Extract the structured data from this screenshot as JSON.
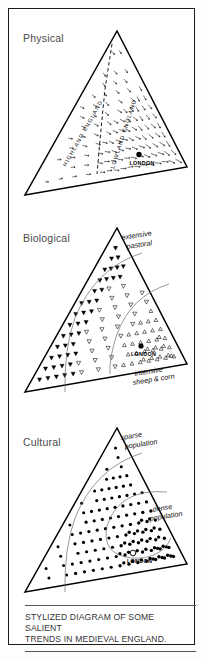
{
  "figure": {
    "caption": "STYLIZED DIAGRAM OF SOME SALIENT\nTRENDS IN MEDIEVAL ENGLAND.",
    "border_color": "#1a1a1a",
    "ink_color": "#000000",
    "background": "#ffffff"
  },
  "panels": [
    {
      "id": "physical",
      "title": "Physical",
      "symbol": "arrow",
      "city": {
        "name": "LONDON",
        "marker": "filled-dot",
        "x": 130,
        "y": 152
      },
      "zone_labels": [
        {
          "text": "HIGHLAND ENGLAND",
          "style": "rotated-caps"
        },
        {
          "text": "LOWLAND ENGLAND",
          "style": "rotated-caps"
        }
      ],
      "divider": "dashed-line"
    },
    {
      "id": "biological",
      "title": "Biological",
      "symbols": [
        "filled-down-triangle",
        "open-down-triangle",
        "open-up-triangle"
      ],
      "city": {
        "name": "LONDON",
        "marker": "filled-dot"
      },
      "annotations": [
        {
          "text": "extensive\npastoral",
          "position": "top-right"
        },
        {
          "text": "intensive\nsheep & corn",
          "position": "bottom-right"
        }
      ]
    },
    {
      "id": "cultural",
      "title": "Cultural",
      "symbol": "dot",
      "city": {
        "name": "LONDON",
        "marker": "open-circle"
      },
      "annotations": [
        {
          "text": "sparse\npopulation",
          "position": "top-right"
        },
        {
          "text": "dense\npopulation",
          "position": "mid-right"
        }
      ]
    }
  ],
  "chart_data": {
    "type": "diagram",
    "title": "STYLIZED DIAGRAM OF SOME SALIENT TRENDS IN MEDIEVAL ENGLAND.",
    "triangle_geometry": {
      "apex": [
        108,
        22
      ],
      "left": [
        16,
        186
      ],
      "right": [
        178,
        158
      ]
    },
    "panels": [
      {
        "name": "Physical",
        "gradient": "relief arrows increasing in density toward the lowland south-east",
        "regions": [
          "HIGHLAND ENGLAND",
          "LOWLAND ENGLAND"
        ],
        "marker": "LONDON"
      },
      {
        "name": "Biological",
        "gradient": "land use from extensive pastoral (filled down triangles) through open down triangles to intensive sheep & corn (dense up triangles)",
        "regions": [
          "extensive pastoral",
          "intensive sheep & corn"
        ],
        "marker": "LONDON"
      },
      {
        "name": "Cultural",
        "gradient": "population density from sparse in the north-west to dense around London",
        "regions": [
          "sparse population",
          "dense population"
        ],
        "marker": "LONDON"
      }
    ]
  }
}
